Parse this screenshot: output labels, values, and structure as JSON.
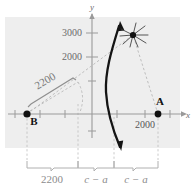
{
  "figure": {
    "type": "hyperbola-navigation-diagram",
    "background_panel_color": "#eeeeee",
    "axis_color": "#9a9a9a",
    "curve_color": "#111111",
    "dashed_color": "#b4b4b4",
    "label_color": "#8a8a8a",
    "point_color": "#111111"
  },
  "axes": {
    "x_label": "x",
    "y_label": "y",
    "y_ticks": [
      {
        "label": "3000",
        "value": 3000
      },
      {
        "label": "2000",
        "value": 2000
      }
    ],
    "x_ticks_labeled": [
      {
        "label": "2000",
        "value": 2000
      }
    ]
  },
  "points": [
    {
      "name": "A",
      "label": "A",
      "x": 2600,
      "y": 0
    },
    {
      "name": "B",
      "label": "B",
      "x": -2200,
      "y": 0
    }
  ],
  "annotations": {
    "distance_from_b": "2200",
    "bracket_left": "2200",
    "bracket_middle": "c − a",
    "bracket_right": "c − a"
  },
  "brackets": [
    {
      "label": "2200"
    },
    {
      "label": "c − a"
    },
    {
      "label": "c − a"
    }
  ],
  "markers": {
    "intersection": "starburst-marker"
  }
}
